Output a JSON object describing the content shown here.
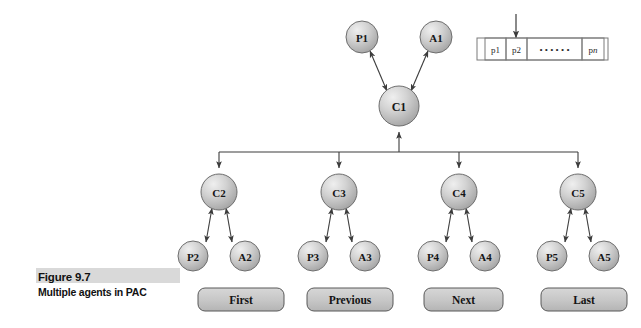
{
  "figure": {
    "caption_number": "Figure 9.7",
    "caption_text": "Multiple agents in PAC",
    "background": "#ffffff",
    "caption_highlight_color": "#d9d9d9"
  },
  "style": {
    "node_fill_light": "#e0e0e0",
    "node_fill_dark": "#a6a6a6",
    "node_stroke": "#6e6e6e",
    "line_color": "#3c3c3c",
    "button_fill": "#c9c9c9",
    "button_stroke": "#595959"
  },
  "diagram": {
    "type": "tree",
    "root": {
      "id": "c1",
      "label": "C1",
      "cx": 399,
      "cy": 106,
      "rx": 20,
      "ry": 20
    },
    "root_agents": [
      {
        "id": "p1",
        "label": "P1",
        "cx": 362,
        "cy": 37,
        "rx": 16,
        "ry": 16
      },
      {
        "id": "a1",
        "label": "A1",
        "cx": 436,
        "cy": 37,
        "rx": 16,
        "ry": 16
      }
    ],
    "controllers": [
      {
        "id": "c2",
        "label": "C2",
        "cx": 219,
        "cy": 192,
        "rx": 18,
        "ry": 18
      },
      {
        "id": "c3",
        "label": "C3",
        "cx": 339,
        "cy": 192,
        "rx": 18,
        "ry": 18
      },
      {
        "id": "c4",
        "label": "C4",
        "cx": 459,
        "cy": 192,
        "rx": 18,
        "ry": 18
      },
      {
        "id": "c5",
        "label": "C5",
        "cx": 578,
        "cy": 192,
        "rx": 18,
        "ry": 18
      }
    ],
    "leaves": [
      {
        "id": "p2",
        "label": "P2",
        "cx": 193,
        "cy": 256,
        "rx": 15,
        "ry": 15,
        "parent": "c2"
      },
      {
        "id": "a2",
        "label": "A2",
        "cx": 245,
        "cy": 256,
        "rx": 15,
        "ry": 15,
        "parent": "c2"
      },
      {
        "id": "p3",
        "label": "P3",
        "cx": 313,
        "cy": 256,
        "rx": 15,
        "ry": 15,
        "parent": "c3"
      },
      {
        "id": "a3",
        "label": "A3",
        "cx": 365,
        "cy": 256,
        "rx": 15,
        "ry": 15,
        "parent": "c3"
      },
      {
        "id": "p4",
        "label": "P4",
        "cx": 433,
        "cy": 256,
        "rx": 15,
        "ry": 15,
        "parent": "c4"
      },
      {
        "id": "a4",
        "label": "A4",
        "cx": 485,
        "cy": 256,
        "rx": 15,
        "ry": 15,
        "parent": "c4"
      },
      {
        "id": "p5",
        "label": "P5",
        "cx": 552,
        "cy": 256,
        "rx": 15,
        "ry": 15,
        "parent": "c5"
      },
      {
        "id": "a5",
        "label": "A5",
        "cx": 604,
        "cy": 256,
        "rx": 15,
        "ry": 15,
        "parent": "c5"
      }
    ],
    "bus": {
      "y": 152,
      "x_left": 219,
      "x_right": 578,
      "stem_x": 399,
      "stem_top": 126
    }
  },
  "buttons": [
    {
      "id": "first",
      "label": "First",
      "x": 198,
      "y": 288,
      "width": 86,
      "height": 23
    },
    {
      "id": "previous",
      "label": "Previous",
      "x": 307,
      "y": 288,
      "width": 86,
      "height": 23
    },
    {
      "id": "next",
      "label": "Next",
      "x": 424,
      "y": 288,
      "width": 79,
      "height": 23
    },
    {
      "id": "last",
      "label": "Last",
      "x": 541,
      "y": 288,
      "width": 86,
      "height": 23
    }
  ],
  "array_widget": {
    "x": 477,
    "y": 38,
    "width": 131,
    "height": 22,
    "pointer": {
      "x": 516,
      "y_top": 14,
      "y_bottom": 36,
      "label": "insertion-pointer"
    },
    "cells": [
      {
        "id": "p1cell",
        "label": "p1",
        "x": 485,
        "width": 21
      },
      {
        "id": "p2cell",
        "label": "p2",
        "x": 506,
        "width": 21
      },
      {
        "id": "dots",
        "label": "• • • • • •",
        "x": 527,
        "width": 55
      },
      {
        "id": "pncell",
        "label": "pn",
        "label_prefix": "p",
        "label_italic": "n",
        "x": 582,
        "width": 22
      }
    ]
  }
}
